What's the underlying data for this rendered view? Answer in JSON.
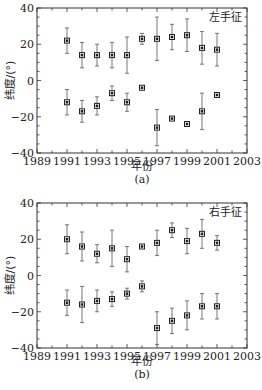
{
  "chart_data": [
    {
      "type": "scatter",
      "title": "左手征",
      "caption": "(a)",
      "xlabel": "年份",
      "ylabel": "纬度/(°)",
      "xlim": [
        1989,
        2003
      ],
      "ylim": [
        -40,
        40
      ],
      "xticks": [
        1989,
        1991,
        1993,
        1995,
        1997,
        1999,
        2001,
        2003
      ],
      "yticks": [
        40,
        20,
        0,
        -20,
        -40
      ],
      "grid": false,
      "series": [
        {
          "name": "north",
          "x": [
            1991,
            1992,
            1993,
            1994,
            1995,
            1996,
            1997,
            1998,
            1999,
            2000,
            2001
          ],
          "y": [
            22,
            14,
            14,
            14,
            14,
            23,
            23,
            24,
            25,
            18,
            17
          ],
          "err": [
            7,
            7,
            6,
            7,
            10,
            3,
            12,
            7,
            9,
            9,
            9
          ]
        },
        {
          "name": "south",
          "x": [
            1991,
            1992,
            1993,
            1994,
            1995,
            1996,
            1997,
            1998,
            1999,
            2000,
            2001
          ],
          "y": [
            -12,
            -17,
            -14,
            -7,
            -12,
            -4,
            -26,
            -21,
            -24,
            -17,
            -8
          ],
          "err": [
            7,
            6,
            5,
            4,
            5,
            0,
            10,
            1,
            1,
            10,
            0
          ]
        }
      ]
    },
    {
      "type": "scatter",
      "title": "右手征",
      "caption": "(b)",
      "xlabel": "年份",
      "ylabel": "纬度/(°)",
      "xlim": [
        1989,
        2003
      ],
      "ylim": [
        -40,
        40
      ],
      "xticks": [
        1989,
        1991,
        1993,
        1995,
        1997,
        1999,
        2001,
        2003
      ],
      "yticks": [
        40,
        20,
        0,
        -20,
        -40
      ],
      "grid": false,
      "series": [
        {
          "name": "north",
          "x": [
            1991,
            1992,
            1993,
            1994,
            1995,
            1996,
            1997,
            1998,
            1999,
            2000,
            2001
          ],
          "y": [
            20,
            16,
            12,
            15,
            9,
            16,
            18,
            25,
            19,
            23,
            18
          ],
          "err": [
            8,
            8,
            5,
            10,
            7,
            1,
            7,
            4,
            7,
            8,
            4
          ]
        },
        {
          "name": "south",
          "x": [
            1991,
            1992,
            1993,
            1994,
            1995,
            1996,
            1997,
            1998,
            1999,
            2000,
            2001
          ],
          "y": [
            -15,
            -16,
            -14,
            -13,
            -10,
            -6,
            -29,
            -25,
            -22,
            -17,
            -17
          ],
          "err": [
            7,
            10,
            6,
            4,
            3,
            3,
            9,
            7,
            8,
            7,
            7
          ]
        }
      ]
    }
  ]
}
